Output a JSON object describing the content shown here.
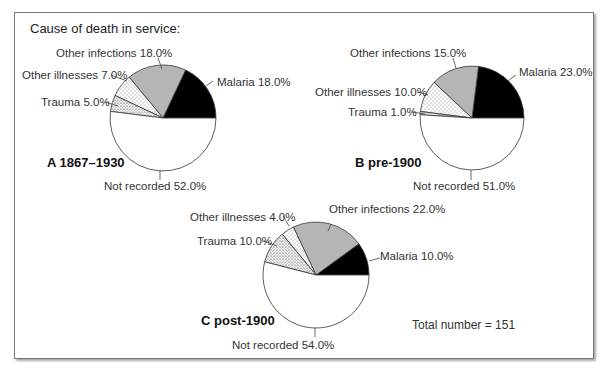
{
  "title": "Cause of death in service:",
  "total_label": "Total number = 151",
  "colors": {
    "malaria": "#000000",
    "other_infections": "#b5b5b5",
    "other_illnesses": "#f2f2f2",
    "trauma": "#e6e6e6",
    "not_recorded": "#ffffff"
  },
  "charts": [
    {
      "panel_label": "A 1867–1930",
      "labels": {
        "malaria": "Malaria 18.0%",
        "other_infections": "Other infections 18.0%",
        "other_illnesses": "Other illnesses 7.0%",
        "trauma": "Trauma 5.0%",
        "not_recorded": "Not recorded 52.0%"
      }
    },
    {
      "panel_label": "B pre-1900",
      "labels": {
        "malaria": "Malaria 23.0%",
        "other_infections": "Other infections 15.0%",
        "other_illnesses": "Other illnesses 10.0%",
        "trauma": "Trauma 1.0%",
        "not_recorded": "Not recorded 51.0%"
      }
    },
    {
      "panel_label": "C post-1900",
      "labels": {
        "malaria": "Malaria 10.0%",
        "other_infections": "Other infections 22.0%",
        "other_illnesses": "Other illnesses 4.0%",
        "trauma": "Trauma 10.0%",
        "not_recorded": "Not recorded 54.0%"
      }
    }
  ],
  "chart_data": [
    {
      "type": "pie",
      "title": "A 1867–1930",
      "categories": [
        "Malaria",
        "Other infections",
        "Other illnesses",
        "Trauma",
        "Not recorded"
      ],
      "values": [
        18.0,
        18.0,
        7.0,
        5.0,
        52.0
      ],
      "unit": "%"
    },
    {
      "type": "pie",
      "title": "B pre-1900",
      "categories": [
        "Malaria",
        "Other infections",
        "Other illnesses",
        "Trauma",
        "Not recorded"
      ],
      "values": [
        23.0,
        15.0,
        10.0,
        1.0,
        51.0
      ],
      "unit": "%"
    },
    {
      "type": "pie",
      "title": "C post-1900",
      "categories": [
        "Malaria",
        "Other infections",
        "Other illnesses",
        "Trauma",
        "Not recorded"
      ],
      "values": [
        10.0,
        22.0,
        4.0,
        10.0,
        54.0
      ],
      "unit": "%"
    }
  ]
}
